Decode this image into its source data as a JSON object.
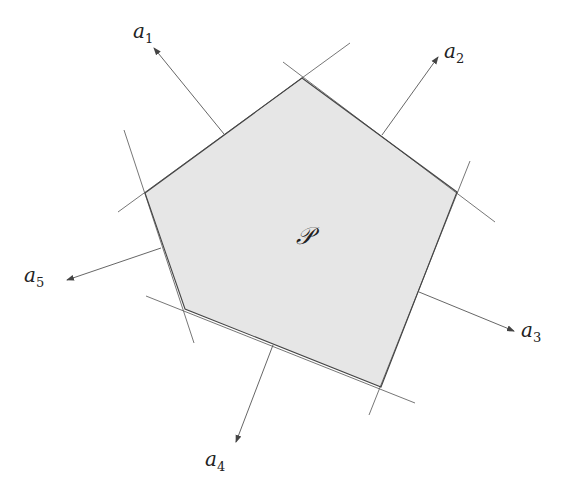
{
  "diagram": {
    "type": "polyhedron-with-outward-normals",
    "region_label": "𝒫",
    "region_fill": "#e6e6e6",
    "line_color": "#555555",
    "polygon_vertices": [
      [
        302,
        78
      ],
      [
        457,
        192
      ],
      [
        381,
        387
      ],
      [
        185,
        309
      ],
      [
        145,
        193
      ]
    ],
    "supporting_lines": [
      {
        "name": "line-1",
        "x1": 118,
        "y1": 212,
        "x2": 350,
        "y2": 43
      },
      {
        "name": "line-2",
        "x1": 283,
        "y1": 62,
        "x2": 495,
        "y2": 222
      },
      {
        "name": "line-3",
        "x1": 470,
        "y1": 161,
        "x2": 369,
        "y2": 415
      },
      {
        "name": "line-4",
        "x1": 415,
        "y1": 403,
        "x2": 146,
        "y2": 296
      },
      {
        "name": "line-5",
        "x1": 194,
        "y1": 343,
        "x2": 124,
        "y2": 130
      }
    ],
    "normals": [
      {
        "label": "a",
        "sub": "1",
        "x1": 224,
        "y1": 134,
        "x2": 154,
        "y2": 48,
        "lx": 133,
        "ly": 38
      },
      {
        "label": "a",
        "sub": "2",
        "x1": 382,
        "y1": 135,
        "x2": 438,
        "y2": 57,
        "lx": 444,
        "ly": 58
      },
      {
        "label": "a",
        "sub": "3",
        "x1": 419,
        "y1": 292,
        "x2": 514,
        "y2": 331,
        "lx": 521,
        "ly": 337
      },
      {
        "label": "a",
        "sub": "4",
        "x1": 273,
        "y1": 345,
        "x2": 236,
        "y2": 442,
        "lx": 205,
        "ly": 466
      },
      {
        "label": "a",
        "sub": "5",
        "x1": 161,
        "y1": 248,
        "x2": 67,
        "y2": 280,
        "lx": 24,
        "ly": 282
      }
    ],
    "region_label_pos": {
      "x": 296,
      "y": 244
    }
  }
}
